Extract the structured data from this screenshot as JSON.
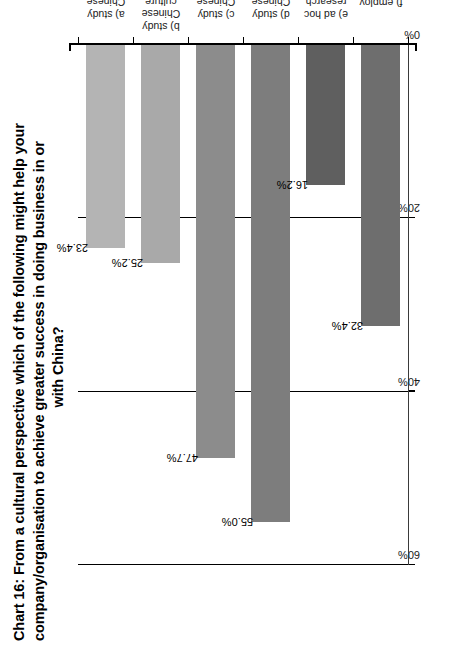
{
  "chart_data": {
    "type": "bar",
    "orientation": "horizontal",
    "title_lines": [
      "Chart 16: From a cultural perspective which of the following might help your",
      "company/organisation to achieve greater success in doing business in or",
      "with China?"
    ],
    "title": "Chart 16: From a cultural perspective which of the following might help your company/organisation to achieve greater success in doing business in or with China?",
    "categories": [
      "a) study Chinese language",
      "b) study Chinese culture",
      "c) study Chinese culture and language combined",
      "d) study Chinese business culture",
      "e) ad hoc research services",
      "f) employ university graduates specialised in Chinese studies"
    ],
    "category_label_lines": [
      [
        "a) study Chinese",
        "language"
      ],
      [
        "b) study Chinese culture"
      ],
      [
        "c) study Chinese culture",
        "and language combined"
      ],
      [
        "d) study Chinese",
        "business culture"
      ],
      [
        "e) ad hoc",
        "research services"
      ],
      [
        "f) employ university",
        "graduates specialised",
        "in Chinese studies"
      ]
    ],
    "values": [
      23.4,
      25.2,
      47.7,
      55.0,
      16.2,
      32.4
    ],
    "value_labels": [
      "23.4%",
      "25.2%",
      "47.7%",
      "55.0%",
      "16.2%",
      "32.4%"
    ],
    "bar_colors": [
      "#b4b4b4",
      "#a9a9a9",
      "#8c8c8c",
      "#7d7d7d",
      "#5f5f5f",
      "#6e6e6e"
    ],
    "xlabel": "",
    "ylabel": "",
    "xlim": [
      0,
      60
    ],
    "tick_labels": [
      "0%",
      "20%",
      "40%",
      "60%"
    ],
    "tick_values": [
      0,
      20,
      40,
      60
    ],
    "grid": true,
    "legend": "none",
    "axis_color": "#000000"
  }
}
